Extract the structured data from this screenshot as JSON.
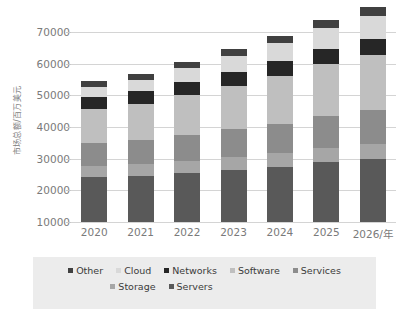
{
  "axis": {
    "y_title": "市场总额/百万美元",
    "y_ticks": [
      "70000",
      "60000",
      "50000",
      "40000",
      "30000",
      "20000",
      "10000"
    ],
    "x_labels": [
      "2020",
      "2021",
      "2022",
      "2023",
      "2024",
      "2025",
      "2026/年"
    ]
  },
  "legend": {
    "row1": [
      {
        "label": "Other",
        "color": "#404040"
      },
      {
        "label": "Cloud",
        "color": "#d9d9d9"
      },
      {
        "label": "Networks",
        "color": "#262626"
      },
      {
        "label": "Software",
        "color": "#bfbfbf"
      },
      {
        "label": "Services",
        "color": "#8c8c8c"
      }
    ],
    "row2": [
      {
        "label": "Storage",
        "color": "#a6a6a6"
      },
      {
        "label": "Servers",
        "color": "#595959"
      }
    ]
  },
  "chart_data": {
    "type": "bar",
    "stacked": true,
    "title": "",
    "xlabel": "年",
    "ylabel": "市场总额/百万美元",
    "ylim": [
      10000,
      77000
    ],
    "ytick_values": [
      10000,
      20000,
      30000,
      40000,
      50000,
      60000,
      70000
    ],
    "grid": true,
    "legend_position": "bottom",
    "categories": [
      "2020",
      "2021",
      "2022",
      "2023",
      "2024",
      "2025",
      "2026"
    ],
    "series": [
      {
        "name": "Servers",
        "color": "#595959",
        "values": [
          14200,
          14600,
          15500,
          16400,
          17300,
          18800,
          20000
        ]
      },
      {
        "name": "Storage",
        "color": "#a6a6a6",
        "values": [
          3400,
          3600,
          3800,
          4100,
          4400,
          4600,
          4700
        ]
      },
      {
        "name": "Services",
        "color": "#8c8c8c",
        "values": [
          7300,
          7600,
          8100,
          8800,
          9400,
          10100,
          10700
        ]
      },
      {
        "name": "Software",
        "color": "#bfbfbf",
        "values": [
          10800,
          11500,
          12700,
          13800,
          15100,
          16400,
          17400
        ]
      },
      {
        "name": "Networks",
        "color": "#262626",
        "values": [
          3900,
          4000,
          4200,
          4300,
          4500,
          4700,
          4900
        ]
      },
      {
        "name": "Cloud",
        "color": "#d9d9d9",
        "values": [
          3000,
          3600,
          4300,
          5000,
          5800,
          6600,
          7500
        ]
      },
      {
        "name": "Other",
        "color": "#404040",
        "values": [
          1800,
          1900,
          2100,
          2200,
          2400,
          2500,
          2600
        ]
      }
    ],
    "totals": [
      54400,
      56800,
      60700,
      64600,
      68900,
      73700,
      77800
    ]
  }
}
